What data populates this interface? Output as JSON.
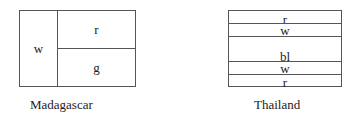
{
  "flags": [
    {
      "country": "Madagascar",
      "cells": [
        {
          "id": "hoist",
          "label": "w"
        },
        {
          "id": "top-right",
          "label": "r"
        },
        {
          "id": "bottom-right",
          "label": "g"
        }
      ]
    },
    {
      "country": "Thailand",
      "stripes": [
        {
          "label": "r"
        },
        {
          "label": "w"
        },
        {
          "label": "bl"
        },
        {
          "label": "w"
        },
        {
          "label": "r"
        }
      ]
    }
  ],
  "colors": {
    "outline": "#555555",
    "text": "#222222",
    "background": "#ffffff"
  }
}
